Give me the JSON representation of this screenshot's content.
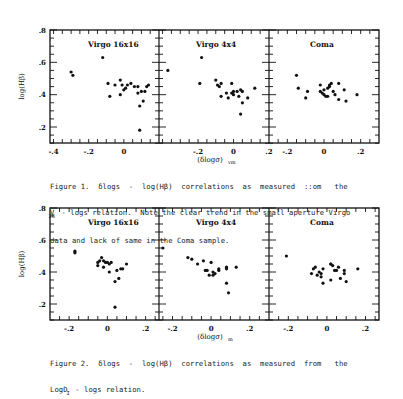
{
  "figures": [
    {
      "caption_lines": [
        "Figure 1.  δlogs  -  log(Hβ)  correlations  as  measured  ::om   the",
        "V   - logs relation.  Note the clear trend in the small aperture Virgo",
        "data and lack of same in the Coma sample."
      ],
      "caption_subscript": "26",
      "xlabel": "(δlogσ)",
      "xlabel_sub": "vm",
      "ylabel": "log(Hβ)"
    },
    {
      "caption_lines": [
        "Figure 2.  δlogs  -  log(Hβ)  correlations  as  measured  from   the",
        "LogD  - logs relation."
      ],
      "caption_subscript": "I",
      "xlabel": "(δlogσ)",
      "xlabel_sub": "m",
      "ylabel": "log(Hβ)"
    }
  ],
  "chart_data": [
    {
      "type": "scatter",
      "title": "Figure 1",
      "ylabel": "log(Hβ)",
      "xlabel": "(δlogσ)vm",
      "ylim": [
        0.1,
        0.8
      ],
      "yticks": [
        ".8",
        ".6",
        ".4",
        ".2"
      ],
      "panels": [
        {
          "name": "Virgo 16x16",
          "xlim": [
            -0.42,
            0.2
          ],
          "xticks": [
            "-.4",
            "-.2",
            "0"
          ],
          "x": [
            -0.3,
            -0.29,
            -0.12,
            -0.09,
            -0.08,
            -0.05,
            -0.02,
            -0.02,
            -0.01,
            0.0,
            0.01,
            0.02,
            0.04,
            0.06,
            0.08,
            0.08,
            0.09,
            0.1,
            0.11,
            0.12,
            0.13,
            0.14,
            0.09
          ],
          "y": [
            0.54,
            0.52,
            0.63,
            0.47,
            0.39,
            0.46,
            0.49,
            0.4,
            0.46,
            0.43,
            0.44,
            0.46,
            0.47,
            0.45,
            0.45,
            0.41,
            0.33,
            0.42,
            0.36,
            0.42,
            0.45,
            0.46,
            0.18
          ]
        },
        {
          "name": "Virgo 4x4",
          "xlim": [
            -0.42,
            0.2
          ],
          "xticks": [
            "-.2",
            "0",
            ".2"
          ],
          "x": [
            -0.37,
            -0.18,
            -0.19,
            -0.1,
            -0.08,
            -0.09,
            -0.07,
            -0.07,
            -0.04,
            -0.03,
            -0.01,
            -0.01,
            0.0,
            0.0,
            0.02,
            0.03,
            0.04,
            0.05,
            0.05,
            0.08,
            0.12
          ],
          "y": [
            0.55,
            0.63,
            0.47,
            0.49,
            0.45,
            0.46,
            0.47,
            0.39,
            0.41,
            0.38,
            0.47,
            0.41,
            0.4,
            0.42,
            0.42,
            0.39,
            0.43,
            0.42,
            0.35,
            0.38,
            0.44
          ],
          "extra": {
            "x": [
              0.04
            ],
            "y": [
              0.28
            ]
          }
        },
        {
          "name": "Coma",
          "xlim": [
            -0.3,
            0.3
          ],
          "xticks": [
            "-.2",
            "0",
            ".2"
          ],
          "x": [
            -0.15,
            -0.14,
            -0.09,
            -0.1,
            -0.02,
            -0.02,
            0.0,
            0.0,
            0.01,
            0.02,
            0.03,
            0.04,
            0.05,
            0.06,
            0.08,
            0.08,
            0.11,
            0.12,
            0.18,
            -0.01,
            0.03,
            0.02
          ],
          "y": [
            0.52,
            0.44,
            0.42,
            0.38,
            0.46,
            0.42,
            0.43,
            0.4,
            0.39,
            0.44,
            0.46,
            0.47,
            0.42,
            0.4,
            0.47,
            0.37,
            0.43,
            0.36,
            0.4,
            0.41,
            0.45,
            0.39
          ]
        }
      ]
    },
    {
      "type": "scatter",
      "title": "Figure 2",
      "ylabel": "log(Hβ)",
      "xlabel": "(δlogσ)m",
      "ylim": [
        0.1,
        0.8
      ],
      "yticks": [
        ".8",
        ".6",
        ".4",
        ".2"
      ],
      "panels": [
        {
          "name": "Virgo 16x16",
          "xlim": [
            -0.3,
            0.27
          ],
          "xticks": [
            "-.2",
            "0",
            ".2"
          ],
          "x": [
            -0.17,
            -0.17,
            -0.05,
            -0.05,
            -0.03,
            -0.04,
            -0.02,
            -0.01,
            -0.02,
            0.0,
            0.01,
            0.02,
            0.01,
            0.04,
            0.05,
            0.07,
            0.08,
            0.06,
            0.1,
            0.04
          ],
          "y": [
            0.53,
            0.52,
            0.46,
            0.44,
            0.49,
            0.47,
            0.47,
            0.46,
            0.43,
            0.46,
            0.45,
            0.46,
            0.4,
            0.34,
            0.41,
            0.42,
            0.42,
            0.36,
            0.45,
            0.18
          ]
        },
        {
          "name": "Virgo 4x4",
          "xlim": [
            -0.27,
            0.3
          ],
          "xticks": [
            "-.2",
            "0",
            ".2"
          ],
          "x": [
            -0.25,
            -0.12,
            -0.1,
            -0.07,
            -0.04,
            -0.03,
            -0.02,
            -0.01,
            0.0,
            0.01,
            0.01,
            0.02,
            0.04,
            0.04,
            0.08,
            0.08,
            0.13,
            0.08,
            0.09
          ],
          "y": [
            0.55,
            0.49,
            0.48,
            0.45,
            0.47,
            0.41,
            0.41,
            0.38,
            0.46,
            0.4,
            0.38,
            0.39,
            0.42,
            0.41,
            0.43,
            0.42,
            0.43,
            0.33,
            0.27
          ]
        },
        {
          "name": "Coma",
          "xlim": [
            -0.3,
            0.27
          ],
          "xticks": [
            "-.2",
            "0",
            ".2"
          ],
          "x": [
            -0.21,
            -0.07,
            -0.06,
            -0.08,
            -0.05,
            -0.04,
            -0.03,
            -0.03,
            -0.02,
            -0.02,
            0.02,
            0.02,
            0.03,
            0.04,
            0.05,
            0.06,
            0.07,
            0.09,
            0.09,
            0.1,
            0.16,
            0.02
          ],
          "y": [
            0.5,
            0.42,
            0.43,
            0.39,
            0.38,
            0.4,
            0.39,
            0.37,
            0.42,
            0.33,
            0.45,
            0.45,
            0.44,
            0.41,
            0.41,
            0.43,
            0.36,
            0.41,
            0.39,
            0.34,
            0.42,
            0.35
          ]
        }
      ]
    }
  ]
}
